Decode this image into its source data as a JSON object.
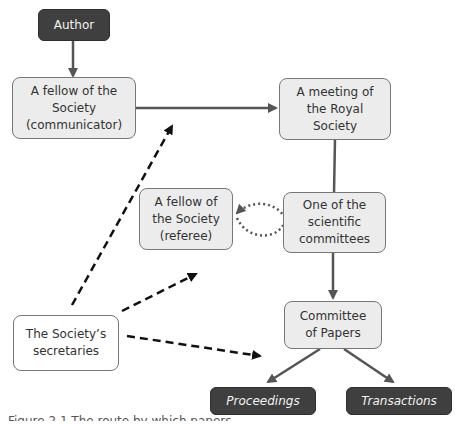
{
  "diagram": {
    "nodes": {
      "author": {
        "label": "Author",
        "style": "dark"
      },
      "communicator": {
        "label_lines": [
          "A fellow of the",
          "Society",
          "(communicator)"
        ]
      },
      "meeting": {
        "label_lines": [
          "A meeting of",
          "the Royal",
          "Society"
        ]
      },
      "referee": {
        "label_lines": [
          "A fellow of",
          "the Society",
          "(referee)"
        ]
      },
      "committees": {
        "label_lines": [
          "One of the",
          "scientific",
          "committees"
        ]
      },
      "secretaries": {
        "label_lines": [
          "The Society’s",
          "secretaries"
        ]
      },
      "papers": {
        "label_lines": [
          "Committee",
          "of Papers"
        ]
      },
      "proceedings": {
        "label": "Proceedings",
        "style": "dark-italic"
      },
      "transactions": {
        "label": "Transactions",
        "style": "dark-italic"
      }
    },
    "edges": [
      {
        "from": "author",
        "to": "communicator",
        "style": "solid"
      },
      {
        "from": "communicator",
        "to": "meeting",
        "style": "solid"
      },
      {
        "from": "meeting",
        "to": "committees",
        "style": "solid"
      },
      {
        "from": "committees",
        "to": "papers",
        "style": "solid"
      },
      {
        "from": "committees",
        "to": "referee",
        "style": "dotted-bidirectional"
      },
      {
        "from": "secretaries",
        "to": "communicator",
        "style": "dashed"
      },
      {
        "from": "secretaries",
        "to": "referee",
        "style": "dashed"
      },
      {
        "from": "secretaries",
        "to": "papers",
        "style": "dashed"
      },
      {
        "from": "papers",
        "to": "proceedings",
        "style": "solid"
      },
      {
        "from": "papers",
        "to": "transactions",
        "style": "solid"
      }
    ],
    "colors": {
      "dark_node": "#3f3f3f",
      "light_node": "#ececec",
      "line": "#555555"
    }
  },
  "caption": "Figure 2.1  The route by which papers..."
}
